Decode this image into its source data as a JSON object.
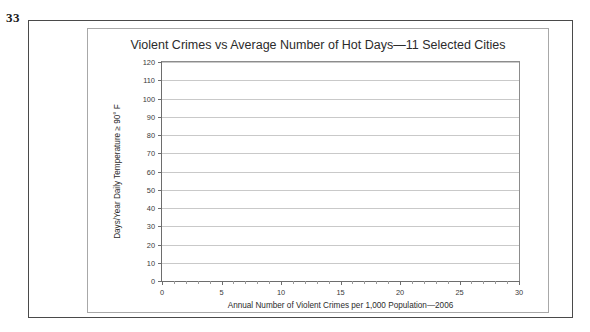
{
  "exercise_number": "33",
  "chart_data": {
    "type": "scatter",
    "title": "Violent Crimes vs Average Number of Hot Days—11 Selected Cities",
    "xlabel": "Annual Number of Violent Crimes per 1,000 Population—2006",
    "ylabel": "Days/Year Daily Temperature ≥ 90° F",
    "xlim": [
      0,
      30
    ],
    "ylim": [
      0,
      120
    ],
    "x_ticks": [
      0,
      5,
      10,
      15,
      20,
      25,
      30
    ],
    "x_tick_labels": [
      "0",
      "5",
      "10",
      "15",
      "20",
      "25",
      "30"
    ],
    "x_minor_tick_step": 1,
    "y_ticks": [
      0,
      10,
      20,
      30,
      40,
      50,
      60,
      70,
      80,
      90,
      100,
      110,
      120
    ],
    "y_tick_labels": [
      "0",
      "10",
      "20",
      "30",
      "40",
      "50",
      "60",
      "70",
      "80",
      "90",
      "100",
      "110",
      "120"
    ],
    "grid": "horizontal",
    "legend": null,
    "series": [
      {
        "name": "11 Selected Cities",
        "x": [],
        "y": []
      }
    ],
    "note": "Blank plotting grid — no data points are plotted in the figure."
  },
  "colors": {
    "frame_outer": "#4a4a4a",
    "frame_inner": "#a8a8a8",
    "axis": "#6d6d6d",
    "gridline": "#c9c9c9",
    "text": "#2b2b2b",
    "background": "#ffffff"
  }
}
